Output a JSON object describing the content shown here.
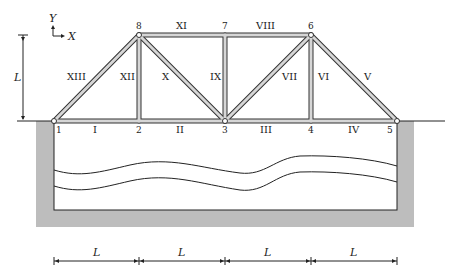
{
  "axes": {
    "x_label": "X",
    "y_label": "Y"
  },
  "height_dimension": "L",
  "span_dimensions": [
    "L",
    "L",
    "L",
    "L"
  ],
  "nodes": [
    {
      "id": "1",
      "x": 54,
      "y": 121
    },
    {
      "id": "2",
      "x": 139,
      "y": 121
    },
    {
      "id": "3",
      "x": 225,
      "y": 121
    },
    {
      "id": "4",
      "x": 311,
      "y": 121
    },
    {
      "id": "5",
      "x": 397,
      "y": 121
    },
    {
      "id": "6",
      "x": 311,
      "y": 35
    },
    {
      "id": "7",
      "x": 225,
      "y": 35
    },
    {
      "id": "8",
      "x": 139,
      "y": 35
    }
  ],
  "members": [
    {
      "id": "I",
      "from": "1",
      "to": "2"
    },
    {
      "id": "II",
      "from": "2",
      "to": "3"
    },
    {
      "id": "III",
      "from": "3",
      "to": "4"
    },
    {
      "id": "IV",
      "from": "4",
      "to": "5"
    },
    {
      "id": "V",
      "from": "5",
      "to": "6"
    },
    {
      "id": "VI",
      "from": "4",
      "to": "6"
    },
    {
      "id": "VII",
      "from": "3",
      "to": "6"
    },
    {
      "id": "VIII",
      "from": "7",
      "to": "6"
    },
    {
      "id": "IX",
      "from": "3",
      "to": "7"
    },
    {
      "id": "X",
      "from": "8",
      "to": "3"
    },
    {
      "id": "XI",
      "from": "8",
      "to": "7"
    },
    {
      "id": "XII",
      "from": "2",
      "to": "8"
    },
    {
      "id": "XIII",
      "from": "1",
      "to": "8"
    }
  ],
  "node_labels": {
    "n1": "1",
    "n2": "2",
    "n3": "3",
    "n4": "4",
    "n5": "5",
    "n6": "6",
    "n7": "7",
    "n8": "8"
  },
  "member_labels": {
    "I": "I",
    "II": "II",
    "III": "III",
    "IV": "IV",
    "V": "V",
    "VI": "VI",
    "VII": "VII",
    "VIII": "VIII",
    "IX": "IX",
    "X": "X",
    "XI": "XI",
    "XII": "XII",
    "XIII": "XIII"
  },
  "colors": {
    "member_fill": "#c8c8c8",
    "member_edge": "#333333",
    "pit": "#bdbdbd",
    "line": "#222222"
  }
}
